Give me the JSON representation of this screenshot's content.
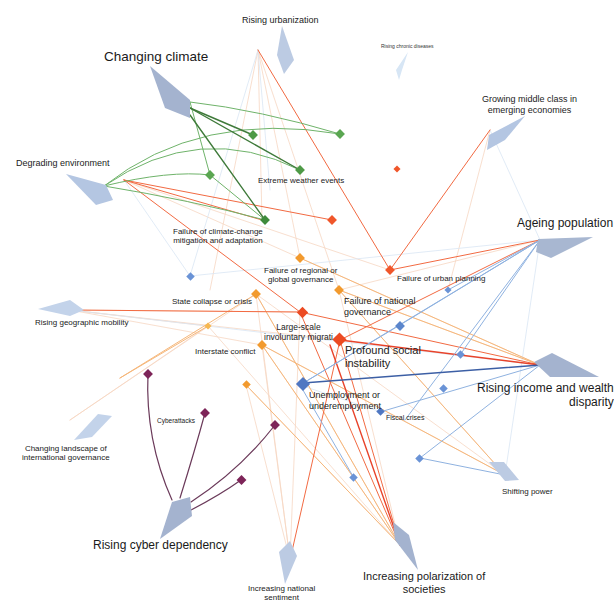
{
  "diagram": {
    "trends": [
      {
        "id": "changing_climate",
        "label": "Changing climate",
        "size": "lg"
      },
      {
        "id": "rising_urbanization",
        "label": "Rising urbanization",
        "size": "md"
      },
      {
        "id": "rising_chronic_diseases",
        "label": "Rising chronic diseases",
        "size": "sm"
      },
      {
        "id": "growing_middle_class",
        "label": "Growing middle class in emerging economies",
        "line1": "Growing middle class in",
        "line2": "emerging economies",
        "size": "md"
      },
      {
        "id": "degrading_environment",
        "label": "Degrading environment",
        "size": "md"
      },
      {
        "id": "ageing_population",
        "label": "Ageing population",
        "size": "lg"
      },
      {
        "id": "rising_geographic_mobility",
        "label": "Rising geographic mobility",
        "size": "md"
      },
      {
        "id": "rising_income_disparity",
        "label": "Rising income and wealth disparity",
        "line1": "Rising income and wealth",
        "line2": "disparity",
        "size": "lg"
      },
      {
        "id": "changing_landscape_governance",
        "label": "Changing landscape of international governance",
        "line1": "Changing landscape of",
        "line2": "international governance",
        "size": "md"
      },
      {
        "id": "shifting_power",
        "label": "Shifting power",
        "size": "md"
      },
      {
        "id": "rising_cyber_dependency",
        "label": "Rising cyber dependency",
        "size": "lg"
      },
      {
        "id": "increasing_national_sentiment",
        "label": "Increasing national sentiment",
        "line1": "Increasing national",
        "line2": "sentiment",
        "size": "md"
      },
      {
        "id": "increasing_polarization",
        "label": "Increasing polarization of societies",
        "line1": "Increasing polarization of",
        "line2": "societies",
        "size": "lg"
      }
    ],
    "risks": [
      {
        "id": "extreme_weather",
        "label": "Extreme weather events",
        "category": "environmental"
      },
      {
        "id": "failure_climate",
        "label": "Failure of climate-change mitigation and adaptation",
        "line1": "Failure of climate-change",
        "line2": "mitigation and adaptation",
        "category": "environmental"
      },
      {
        "id": "failure_regional_gov",
        "label": "Failure of regional or global governance",
        "line1": "Failure of regional or",
        "line2": "global governance",
        "category": "geopolitical"
      },
      {
        "id": "failure_urban_planning",
        "label": "Failure of urban planning",
        "category": "societal"
      },
      {
        "id": "state_collapse",
        "label": "State collapse or crisis",
        "category": "geopolitical"
      },
      {
        "id": "failure_national_gov",
        "label": "Failure of national governance",
        "line1": "Failure of national",
        "line2": "governance",
        "category": "geopolitical"
      },
      {
        "id": "involuntary_migration",
        "label": "Large-scale involuntary migrati",
        "line1": "Large-scale",
        "line2": "involuntary migrati",
        "category": "societal"
      },
      {
        "id": "interstate_conflict",
        "label": "Interstate conflict",
        "category": "geopolitical"
      },
      {
        "id": "profound_social_instability",
        "label": "Profound social instability",
        "line1": "Profound social",
        "line2": "instability",
        "category": "societal"
      },
      {
        "id": "unemployment",
        "label": "Unemployment or underemployment",
        "line1": "Unemployment or",
        "line2": "underemployment",
        "category": "economic"
      },
      {
        "id": "fiscal_crises",
        "label": "Fiscal crises",
        "category": "economic"
      },
      {
        "id": "cyberattacks",
        "label": "Cyberattacks",
        "category": "technological"
      }
    ],
    "category_colors": {
      "trend": "#a9b8d3",
      "trend_light": "#c8d6ea",
      "trend_faint": "#dbe8f5",
      "environmental": "#4e9a46",
      "environmental_dark": "#3f7a3a",
      "societal": "#f0562a",
      "geopolitical": "#f29a2e",
      "geopolitical_light": "#f6c77d",
      "economic": "#5b86cc",
      "economic_dark": "#3c5fa5",
      "technological": "#7d2458"
    }
  }
}
